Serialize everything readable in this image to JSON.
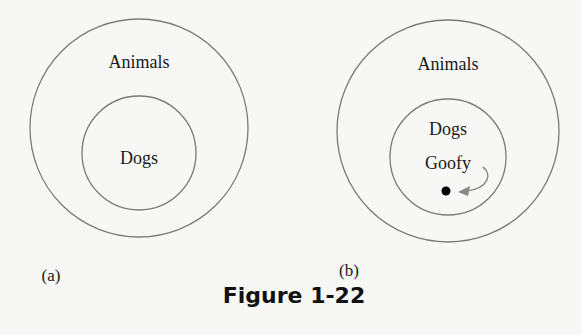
{
  "figure": {
    "caption": "Figure 1-22",
    "panels": [
      {
        "id": "a",
        "label": "(a)",
        "outer_set": "Animals",
        "inner_set": "Dogs"
      },
      {
        "id": "b",
        "label": "(b)",
        "outer_set": "Animals",
        "inner_set": "Dogs",
        "element": "Goofy"
      }
    ]
  },
  "colors": {
    "background": "#f7f7f5",
    "circle_stroke": "#7a7a7a",
    "text": "#1a1a1a",
    "arrow": "#888888",
    "point": "#000000"
  }
}
